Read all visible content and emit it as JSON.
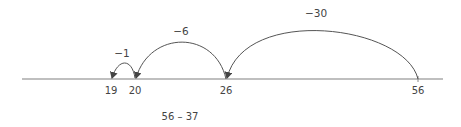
{
  "diagram": {
    "type": "number-line",
    "expression": "56 – 37",
    "points": [
      {
        "value": "19",
        "x": 111
      },
      {
        "value": "20",
        "x": 135
      },
      {
        "value": "26",
        "x": 226
      },
      {
        "value": "56",
        "x": 418
      }
    ],
    "jumps": [
      {
        "label": "−30",
        "from": "56",
        "to": "26"
      },
      {
        "label": "−6",
        "from": "26",
        "to": "20"
      },
      {
        "label": "−1",
        "from": "20",
        "to": "19"
      }
    ],
    "colors": {
      "line": "#aaaaaa",
      "arc": "#555555",
      "text": "#444444"
    }
  }
}
